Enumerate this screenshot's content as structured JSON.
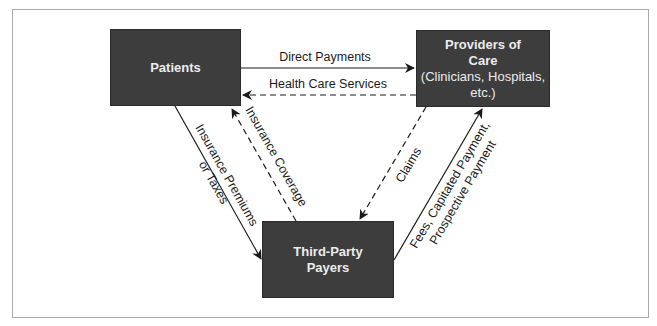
{
  "diagram": {
    "nodes": {
      "patients": {
        "label": "Patients"
      },
      "providers": {
        "line1": "Providers of",
        "line2": "Care",
        "line3": "(Clinicians, Hospitals,",
        "line4": "etc.)"
      },
      "payers": {
        "line1": "Third-Party",
        "line2": "Payers"
      }
    },
    "edges": {
      "direct_payments": "Direct Payments",
      "health_care_services": "Health Care Services",
      "premiums_line1": "Insurance Premiums",
      "premiums_line2": "or Taxes",
      "coverage": "Insurance Coverage",
      "claims": "Claims",
      "fees_line1": "Fees, Capitated Payment,",
      "fees_line2": "Prospective Payment"
    },
    "colors": {
      "node_fill": "#3d3d3d",
      "node_text": "#ececec",
      "line": "#1a1a1a",
      "frame": "#a8a8a8"
    }
  }
}
